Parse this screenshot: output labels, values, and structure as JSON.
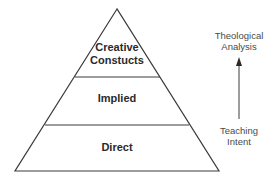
{
  "pyramid": {
    "levels": [
      {
        "label_line1": "Creative",
        "label_line2": "Constucts"
      },
      {
        "label": "Implied"
      },
      {
        "label": "Direct"
      }
    ]
  },
  "axis": {
    "top_line1": "Theological",
    "top_line2": "Analysis",
    "bottom_line1": "Teaching",
    "bottom_line2": "Intent",
    "direction": "up"
  },
  "colors": {
    "line": "#3a3a3a",
    "text": "#2a2a2a",
    "background": "#ffffff"
  }
}
